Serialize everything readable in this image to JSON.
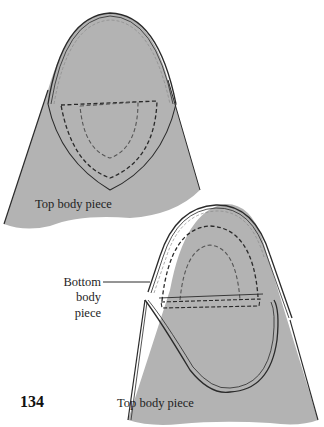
{
  "page": {
    "header_cropped": "",
    "page_number": "134"
  },
  "figure": {
    "fill_color": "#b3b3b3",
    "line_color": "#2a2a2a",
    "labels": {
      "top_piece_1": "Top body piece",
      "bottom_piece_line1": "Bottom",
      "bottom_piece_line2": "body",
      "bottom_piece_line3": "piece",
      "top_piece_2": "Top body piece"
    }
  }
}
